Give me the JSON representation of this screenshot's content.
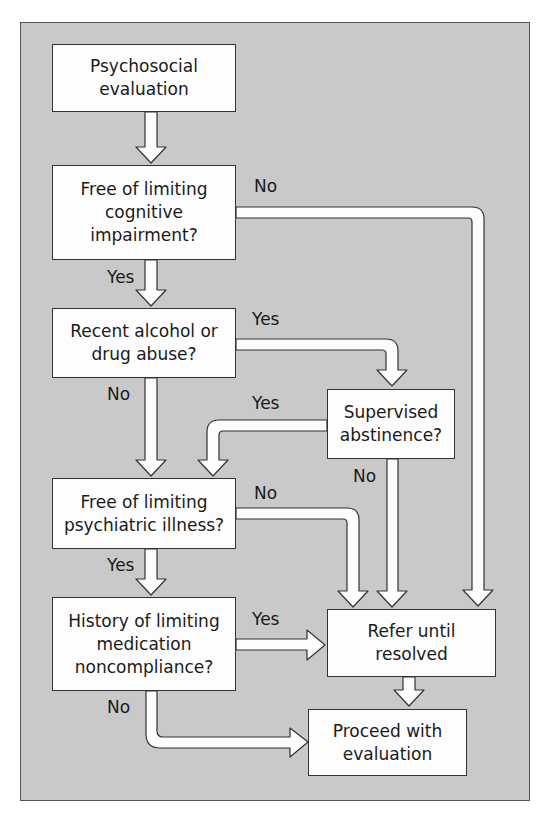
{
  "colors": {
    "background": "#c9c9c9",
    "box_fill": "#fdfdfd",
    "stroke": "#333333",
    "text": "#1a1a1a"
  },
  "nodes": {
    "start": "Psychosocial evaluation",
    "cognitive": "Free of limiting cognitive impairment?",
    "substance": "Recent alcohol or drug abuse?",
    "abstinence": "Supervised abstinence?",
    "psychiatric": "Free of limiting psychiatric illness?",
    "compliance": "History of limiting medication noncompliance?",
    "refer": "Refer until resolved",
    "proceed": "Proceed with evaluation"
  },
  "edge_labels": {
    "cognitive_no": "No",
    "cognitive_yes": "Yes",
    "substance_yes": "Yes",
    "substance_no": "No",
    "abstinence_yes": "Yes",
    "abstinence_no": "No",
    "psychiatric_no": "No",
    "psychiatric_yes": "Yes",
    "compliance_yes": "Yes",
    "compliance_no": "No"
  },
  "edges": [
    {
      "from": "start",
      "to": "cognitive",
      "label": ""
    },
    {
      "from": "cognitive",
      "to": "substance",
      "label": "Yes"
    },
    {
      "from": "cognitive",
      "to": "refer",
      "label": "No"
    },
    {
      "from": "substance",
      "to": "abstinence",
      "label": "Yes"
    },
    {
      "from": "substance",
      "to": "psychiatric",
      "label": "No"
    },
    {
      "from": "abstinence",
      "to": "psychiatric",
      "label": "Yes"
    },
    {
      "from": "abstinence",
      "to": "refer",
      "label": "No"
    },
    {
      "from": "psychiatric",
      "to": "compliance",
      "label": "Yes"
    },
    {
      "from": "psychiatric",
      "to": "refer",
      "label": "No"
    },
    {
      "from": "compliance",
      "to": "refer",
      "label": "Yes"
    },
    {
      "from": "compliance",
      "to": "proceed",
      "label": "No"
    },
    {
      "from": "refer",
      "to": "proceed",
      "label": ""
    }
  ]
}
